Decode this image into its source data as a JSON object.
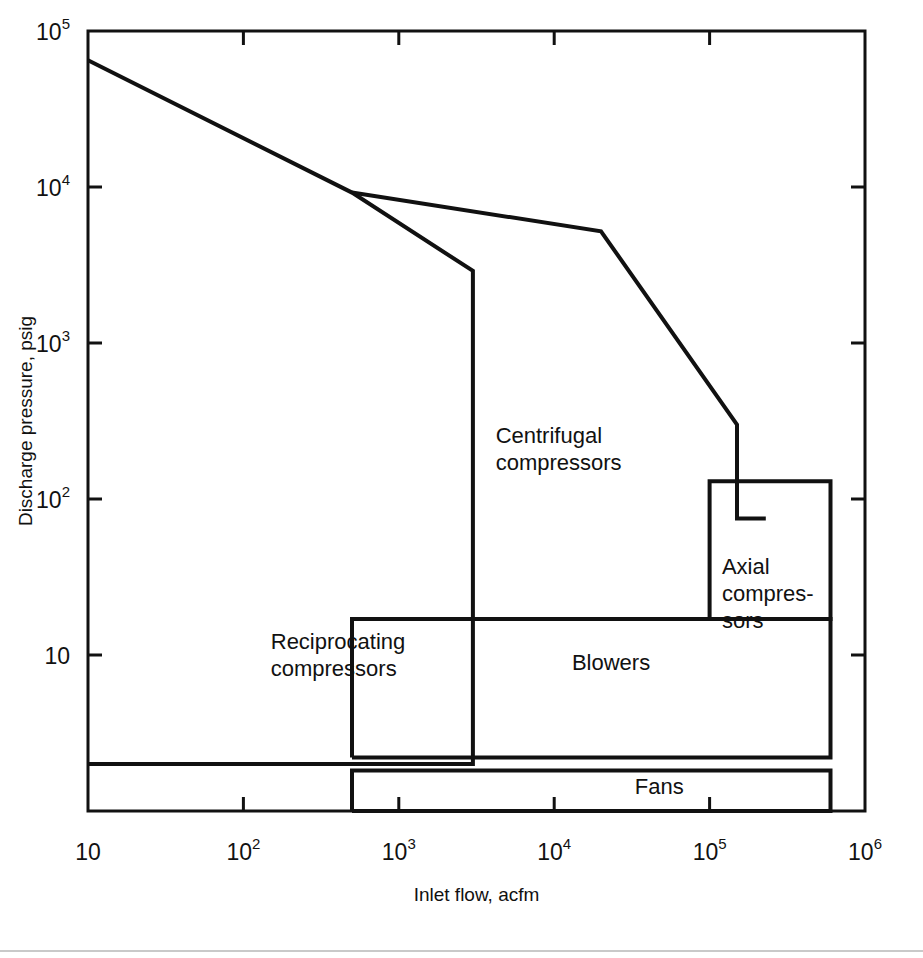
{
  "chart_data": {
    "type": "line",
    "title": "",
    "xlabel": "Inlet flow, acfm",
    "ylabel": "Discharge pressure, psig",
    "xscale": "log",
    "yscale": "log",
    "xlim": [
      10,
      1000000
    ],
    "ylim": [
      1,
      100000
    ],
    "grid": false,
    "legend": "none",
    "xticks": [
      {
        "value": 10,
        "label": "10",
        "mantissa": "10",
        "exponent": ""
      },
      {
        "value": 100,
        "label": "10^2",
        "mantissa": "10",
        "exponent": "2"
      },
      {
        "value": 1000,
        "label": "10^3",
        "mantissa": "10",
        "exponent": "3"
      },
      {
        "value": 10000,
        "label": "10^4",
        "mantissa": "10",
        "exponent": "4"
      },
      {
        "value": 100000,
        "label": "10^5",
        "mantissa": "10",
        "exponent": "5"
      },
      {
        "value": 1000000,
        "label": "10^6",
        "mantissa": "10",
        "exponent": "6"
      }
    ],
    "yticks": [
      {
        "value": 10,
        "label": "10",
        "mantissa": "10",
        "exponent": ""
      },
      {
        "value": 100,
        "label": "10^2",
        "mantissa": "10",
        "exponent": "2"
      },
      {
        "value": 1000,
        "label": "10^3",
        "mantissa": "10",
        "exponent": "3"
      },
      {
        "value": 10000,
        "label": "10^4",
        "mantissa": "10",
        "exponent": "4"
      },
      {
        "value": 100000,
        "label": "10^5",
        "mantissa": "10",
        "exponent": "5"
      }
    ],
    "regions": [
      {
        "name": "reciprocating-compressors",
        "label_lines": [
          "Reciprocating",
          "compressors"
        ],
        "label_x": 150,
        "label_y": 11,
        "boundary": [
          [
            10,
            65000
          ],
          [
            500,
            9200
          ],
          [
            3000,
            2900
          ],
          [
            3000,
            2.0
          ],
          [
            10,
            2.0
          ]
        ]
      },
      {
        "name": "centrifugal-compressors",
        "label_lines": [
          "Centrifugal",
          "compressors"
        ],
        "label_x": 4200,
        "label_y": 230,
        "boundary": [
          [
            500,
            9200
          ],
          [
            20000,
            5200
          ],
          [
            150000,
            300
          ],
          [
            150000,
            75
          ],
          [
            230000,
            75
          ]
        ]
      },
      {
        "name": "axial-compressors",
        "label_lines": [
          "Axial",
          "compres-",
          "sors"
        ],
        "label_x": 120000,
        "label_y": 33,
        "boundary": [
          [
            100000,
            17
          ],
          [
            100000,
            130
          ],
          [
            600000,
            130
          ],
          [
            600000,
            17
          ],
          [
            100000,
            17
          ]
        ]
      },
      {
        "name": "blowers",
        "label_lines": [
          "Blowers"
        ],
        "label_x": 13000,
        "label_y": 8.0,
        "boundary": [
          [
            500,
            2.2
          ],
          [
            500,
            17
          ],
          [
            600000,
            17
          ],
          [
            600000,
            2.2
          ],
          [
            500,
            2.2
          ]
        ]
      },
      {
        "name": "fans",
        "label_lines": [
          "Fans"
        ],
        "label_x": 33000,
        "label_y": 1.28,
        "boundary": [
          [
            500,
            1.0
          ],
          [
            500,
            1.82
          ],
          [
            600000,
            1.82
          ],
          [
            600000,
            1.0
          ],
          [
            500,
            1.0
          ]
        ]
      }
    ]
  },
  "axes": {
    "x_title": "Inlet flow, acfm",
    "y_title": "Discharge pressure, psig"
  }
}
